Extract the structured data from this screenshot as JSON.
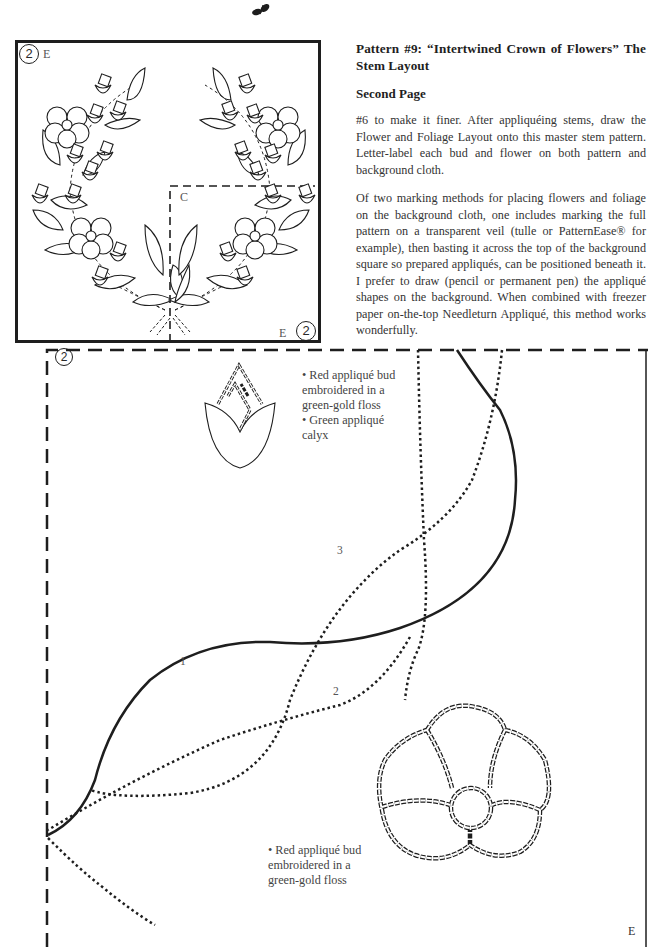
{
  "page": {
    "ornament": "leaf-sprig-ornament",
    "title": "Pattern #9: “Intertwined Crown of Flowers” The Stem Layout",
    "subtitle": "Second Page",
    "paragraphs": [
      "#6 to make it finer. After appliquéing stems, draw the Flower and Foliage Layout onto this master stem pattern. Letter-label each bud and flower on both pattern and background cloth.",
      "Of two marking methods for placing flowers and foliage on the background cloth, one includes marking the full pattern on a transparent veil (tulle or PatternEase® for example), then basting it across the top of the background square so prepared appliqués, can be positioned beneath it. I prefer to draw (pencil or permanent pen) the appliqué shapes on the background. When combined with freezer paper on-the-top Needleturn Appliqué, this method works wonderfully."
    ]
  },
  "overview_figure": {
    "section_number": "2",
    "top_left_letter": "E",
    "bottom_right_letter": "E",
    "inner_section_letter": "C",
    "description": "wreath of flowers, buds and leaves"
  },
  "detail_figure": {
    "section_number": "2",
    "corner_letter": "E",
    "stem_labels": [
      "1",
      "2",
      "3"
    ],
    "notes": [
      {
        "lines": [
          "• Red appliqué bud",
          "embroidered in a",
          "green-gold floss",
          "• Green appliqué",
          "calyx"
        ]
      },
      {
        "lines": [
          "• Red appliqué bud",
          "embroidered in a",
          "green-gold floss"
        ]
      }
    ]
  },
  "colors": {
    "ink": "#1e1e1e",
    "text": "#333333",
    "paper": "#ffffff"
  }
}
